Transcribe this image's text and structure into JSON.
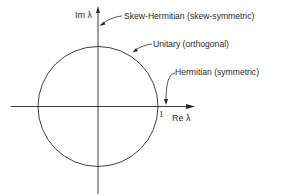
{
  "diagram": {
    "type": "complex-plane eigenvalue locations",
    "axes": {
      "x_label": "Re λ",
      "y_label": "Im λ",
      "unit_tick_label": "1"
    },
    "circle": {
      "description": "unit circle",
      "label": "Unitary (orthogonal)"
    },
    "annotations": [
      {
        "id": "skew-hermitian",
        "label": "Skew-Hermitian (skew-symmetric)",
        "points_to": "imaginary axis"
      },
      {
        "id": "unitary",
        "label": "Unitary (orthogonal)",
        "points_to": "unit circle"
      },
      {
        "id": "hermitian",
        "label": "Hermitian (symmetric)",
        "points_to": "real axis"
      }
    ],
    "colors": {
      "line": "#2a2a2a",
      "background": "#ffffff"
    }
  }
}
